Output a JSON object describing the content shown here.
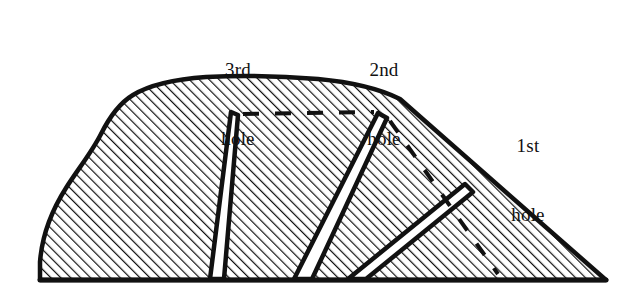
{
  "figure": {
    "type": "cross-section-diagram",
    "background_color": "#ffffff",
    "ink_color": "#111111",
    "hatch": {
      "angle_deg": 45,
      "spacing_px": 7,
      "stroke_width_px": 2.2,
      "color": "#111111"
    },
    "outline": {
      "stroke_width_px": 4,
      "color": "#111111",
      "baseline_y": 280,
      "left_x": 40,
      "right_x": 606,
      "apex_y": 78
    },
    "labels": [
      {
        "id": "label-3rd-hole",
        "line1": "3rd",
        "line2": "hole",
        "x": 196,
        "y": 12
      },
      {
        "id": "label-2nd-hole",
        "line1": "2nd",
        "line2": "hole",
        "x": 342,
        "y": 12
      },
      {
        "id": "label-1st-hole",
        "line1": "1st",
        "line2": "hole",
        "x": 486,
        "y": 88
      }
    ],
    "holes": [
      {
        "name": "1st hole",
        "order": 1,
        "top": [
          465,
          186
        ],
        "bottom": [
          356,
          279
        ],
        "orientation": "diagonal-down-left"
      },
      {
        "name": "2nd hole",
        "order": 2,
        "top": [
          378,
          113
        ],
        "bottom": [
          302,
          279
        ],
        "orientation": "diagonal-down-left"
      },
      {
        "name": "3rd hole",
        "order": 3,
        "top": [
          231,
          112
        ],
        "bottom": [
          217,
          279
        ],
        "orientation": "near-vertical"
      }
    ],
    "dashed_lines": [
      {
        "name": "upper-horizontal-dashed",
        "from": [
          243,
          114
        ],
        "to": [
          376,
          112
        ]
      },
      {
        "name": "right-slope-dashed",
        "from": [
          388,
          120
        ],
        "to": [
          496,
          272
        ]
      }
    ]
  }
}
